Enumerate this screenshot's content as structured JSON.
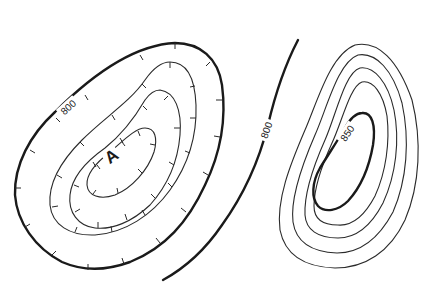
{
  "map": {
    "type": "topographic contour map",
    "features": [
      {
        "name": "depression",
        "point_label": "A",
        "contour_style": "hachured (depression contours, ticks pointing inward)",
        "index_contour_label": "800",
        "contour_count": 4
      },
      {
        "name": "ridge-contour",
        "index_contour_label": "800",
        "contour_count": 1
      },
      {
        "name": "hill",
        "index_contour_label": "850",
        "contour_count": 6
      }
    ],
    "labels": {
      "depression_800": "800",
      "point_a": "A",
      "middle_800": "800",
      "hill_850": "850"
    },
    "colors": {
      "background": "#ffffff",
      "contour": "#1a1a1a"
    }
  }
}
